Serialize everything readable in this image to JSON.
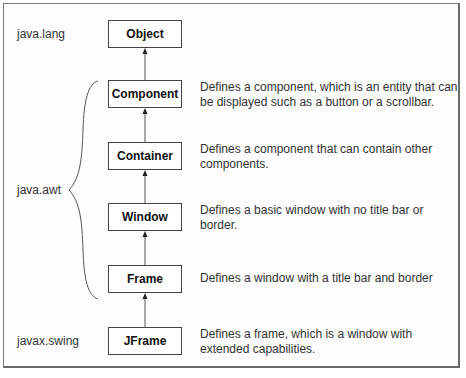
{
  "packages": {
    "lang": "java.lang",
    "awt": "java.awt",
    "swing": "javax.swing"
  },
  "classes": [
    {
      "name": "Object",
      "description": ""
    },
    {
      "name": "Component",
      "description": "Defines a component, which is an entity that can be displayed such as a button or a scrollbar."
    },
    {
      "name": "Container",
      "description": "Defines a component that can contain other components."
    },
    {
      "name": "Window",
      "description": "Defines a basic window with no title bar or border."
    },
    {
      "name": "Frame",
      "description": "Defines a window with a title bar and border"
    },
    {
      "name": "JFrame",
      "description": "Defines a frame, which is a window with extended capabilities."
    }
  ],
  "colors": {
    "border": "#444444",
    "frame": "#7a7a7a",
    "text": "#333333"
  }
}
